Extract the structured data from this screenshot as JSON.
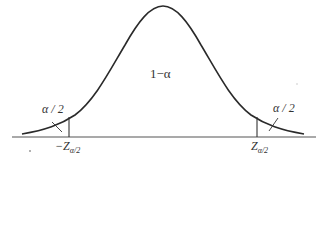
{
  "diagram": {
    "title": "",
    "type": "normal-distribution-two-tailed",
    "labels": {
      "center_area": "1−α",
      "left_tail_area": "α / 2",
      "right_tail_area": "α / 2",
      "left_critical": "−Z",
      "left_critical_sub": "α/2",
      "right_critical": "Z",
      "right_critical_sub": "α/2"
    },
    "colors": {
      "curve": "#2a2a2a",
      "axis": "#444444",
      "text": "#333333"
    }
  }
}
